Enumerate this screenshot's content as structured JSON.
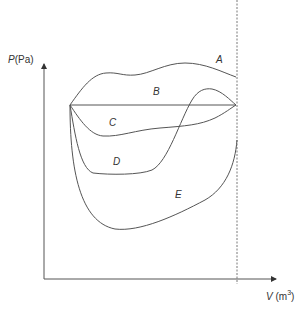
{
  "axes": {
    "y_label_var": "P",
    "y_label_unit": "(Pa)",
    "x_label_var": "V",
    "x_label_unit_base": "(m",
    "x_label_unit_exp": "3",
    "x_label_unit_close": ")"
  },
  "curves": [
    {
      "id": "A",
      "label": "A"
    },
    {
      "id": "B",
      "label": "B"
    },
    {
      "id": "C",
      "label": "C"
    },
    {
      "id": "D",
      "label": "D"
    },
    {
      "id": "E",
      "label": "E"
    }
  ],
  "colors": {
    "line": "#555555",
    "text": "#333333"
  }
}
